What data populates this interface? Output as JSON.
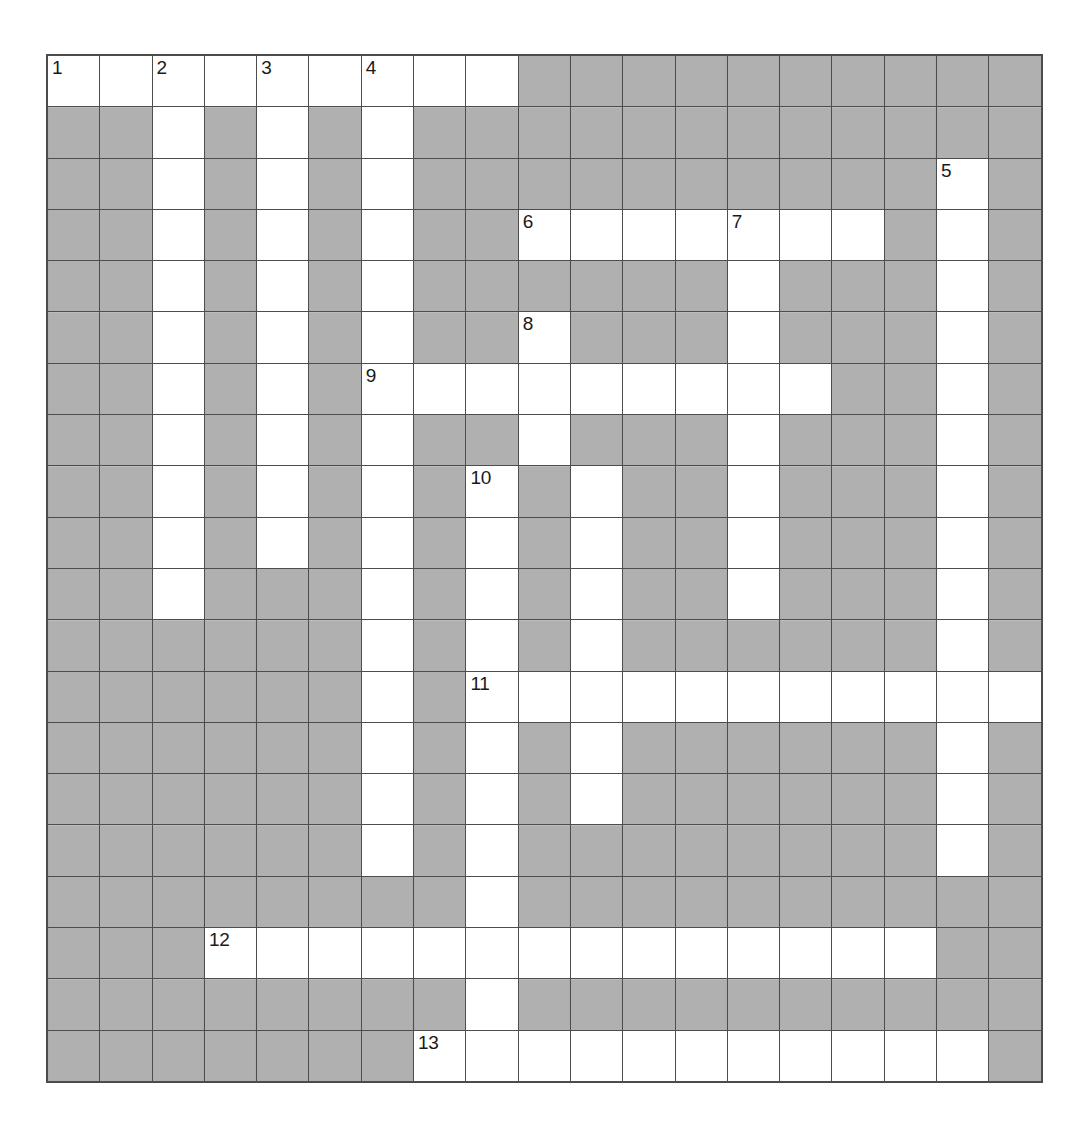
{
  "puzzle": {
    "title": "Crossword Grid",
    "type": "crossword",
    "columns": 19,
    "rows": 20,
    "colors": {
      "block_fill": "#a8a8a8",
      "open_fill": "#ffffff",
      "grid_line": "#4d4d4d",
      "number_text": "#1a1a1a",
      "page_background": "#ffffff"
    },
    "clue_numbers": [
      1,
      2,
      3,
      4,
      5,
      6,
      7,
      8,
      9,
      10,
      11,
      12,
      13
    ],
    "number_positions": [
      {
        "number": 1,
        "row": 1,
        "col": 1
      },
      {
        "number": 2,
        "row": 1,
        "col": 3
      },
      {
        "number": 3,
        "row": 1,
        "col": 5
      },
      {
        "number": 4,
        "row": 1,
        "col": 7
      },
      {
        "number": 5,
        "row": 3,
        "col": 18
      },
      {
        "number": 6,
        "row": 4,
        "col": 10
      },
      {
        "number": 7,
        "row": 4,
        "col": 14
      },
      {
        "number": 8,
        "row": 6,
        "col": 10
      },
      {
        "number": 9,
        "row": 7,
        "col": 7
      },
      {
        "number": 10,
        "row": 9,
        "col": 9
      },
      {
        "number": 11,
        "row": 13,
        "col": 9
      },
      {
        "number": 12,
        "row": 18,
        "col": 4
      },
      {
        "number": 13,
        "row": 20,
        "col": 8
      }
    ],
    "grid": [
      [
        "open",
        "open",
        "open",
        "open",
        "open",
        "open",
        "open",
        "open",
        "open",
        "block",
        "block",
        "block",
        "block",
        "block",
        "block",
        "block",
        "block",
        "block",
        "block"
      ],
      [
        "block",
        "block",
        "open",
        "block",
        "open",
        "block",
        "open",
        "block",
        "block",
        "block",
        "block",
        "block",
        "block",
        "block",
        "block",
        "block",
        "block",
        "block",
        "block"
      ],
      [
        "block",
        "block",
        "open",
        "block",
        "open",
        "block",
        "open",
        "block",
        "block",
        "block",
        "block",
        "block",
        "block",
        "block",
        "block",
        "block",
        "block",
        "open",
        "block"
      ],
      [
        "block",
        "block",
        "open",
        "block",
        "open",
        "block",
        "open",
        "block",
        "block",
        "open",
        "open",
        "open",
        "open",
        "open",
        "open",
        "open",
        "block",
        "open",
        "block"
      ],
      [
        "block",
        "block",
        "open",
        "block",
        "open",
        "block",
        "open",
        "block",
        "block",
        "block",
        "block",
        "block",
        "block",
        "open",
        "block",
        "block",
        "block",
        "open",
        "block"
      ],
      [
        "block",
        "block",
        "open",
        "block",
        "open",
        "block",
        "open",
        "block",
        "block",
        "open",
        "block",
        "block",
        "block",
        "open",
        "block",
        "block",
        "block",
        "open",
        "block"
      ],
      [
        "block",
        "block",
        "open",
        "block",
        "open",
        "block",
        "open",
        "open",
        "open",
        "open",
        "open",
        "open",
        "open",
        "open",
        "open",
        "block",
        "block",
        "open",
        "block"
      ],
      [
        "block",
        "block",
        "open",
        "block",
        "open",
        "block",
        "open",
        "block",
        "block",
        "open",
        "block",
        "block",
        "block",
        "open",
        "block",
        "block",
        "block",
        "open",
        "block"
      ],
      [
        "block",
        "block",
        "open",
        "block",
        "open",
        "block",
        "open",
        "block",
        "open",
        "block",
        "open",
        "block",
        "block",
        "open",
        "block",
        "block",
        "block",
        "open",
        "block"
      ],
      [
        "block",
        "block",
        "open",
        "block",
        "open",
        "block",
        "open",
        "block",
        "open",
        "block",
        "open",
        "block",
        "block",
        "open",
        "block",
        "block",
        "block",
        "open",
        "block"
      ],
      [
        "block",
        "block",
        "open",
        "block",
        "block",
        "block",
        "open",
        "block",
        "open",
        "block",
        "open",
        "block",
        "block",
        "open",
        "block",
        "block",
        "block",
        "open",
        "block"
      ],
      [
        "block",
        "block",
        "block",
        "block",
        "block",
        "block",
        "open",
        "block",
        "open",
        "block",
        "open",
        "block",
        "block",
        "block",
        "block",
        "block",
        "block",
        "open",
        "block"
      ],
      [
        "block",
        "block",
        "block",
        "block",
        "block",
        "block",
        "open",
        "block",
        "open",
        "open",
        "open",
        "open",
        "open",
        "open",
        "open",
        "open",
        "open",
        "open",
        "open"
      ],
      [
        "block",
        "block",
        "block",
        "block",
        "block",
        "block",
        "open",
        "block",
        "open",
        "block",
        "open",
        "block",
        "block",
        "block",
        "block",
        "block",
        "block",
        "open",
        "block"
      ],
      [
        "block",
        "block",
        "block",
        "block",
        "block",
        "block",
        "open",
        "block",
        "open",
        "block",
        "open",
        "block",
        "block",
        "block",
        "block",
        "block",
        "block",
        "open",
        "block"
      ],
      [
        "block",
        "block",
        "block",
        "block",
        "block",
        "block",
        "open",
        "block",
        "open",
        "block",
        "block",
        "block",
        "block",
        "block",
        "block",
        "block",
        "block",
        "open",
        "block"
      ],
      [
        "block",
        "block",
        "block",
        "block",
        "block",
        "block",
        "block",
        "block",
        "open",
        "block",
        "block",
        "block",
        "block",
        "block",
        "block",
        "block",
        "block",
        "block",
        "block"
      ],
      [
        "block",
        "block",
        "block",
        "open",
        "open",
        "open",
        "open",
        "open",
        "open",
        "open",
        "open",
        "open",
        "open",
        "open",
        "open",
        "open",
        "open",
        "block",
        "block"
      ],
      [
        "block",
        "block",
        "block",
        "block",
        "block",
        "block",
        "block",
        "block",
        "open",
        "block",
        "block",
        "block",
        "block",
        "block",
        "block",
        "block",
        "block",
        "block",
        "block"
      ],
      [
        "block",
        "block",
        "block",
        "block",
        "block",
        "block",
        "block",
        "open",
        "open",
        "open",
        "open",
        "open",
        "open",
        "open",
        "open",
        "open",
        "open",
        "open",
        "block"
      ]
    ]
  }
}
